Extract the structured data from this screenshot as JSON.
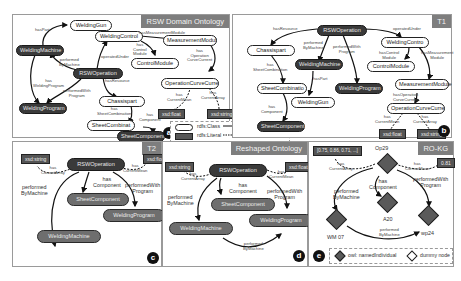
{
  "panels": {
    "a": {
      "title": "RSW Domain Ontology",
      "badge": "a",
      "nodes": {
        "welding_gun": "WeldingGun",
        "welding_machine": "WeldingMachine",
        "welding_control": "WeldingControl",
        "measurement_module": "MeasurementModul",
        "control_module": "ControlModule",
        "rsw_operation": "RSWOperation",
        "welding_program": "WeldingProgram",
        "operation_curve": "OperationCurveCurre",
        "chassis_part": "Chassispart",
        "sheet_combination": "SheetCombinat",
        "sheet_component": "SheetComponent",
        "lit_float": "xsd:float",
        "lit_string": "xsd:string"
      },
      "edges": {
        "has_part": "hasPart",
        "performed_by_machine": "performed\nByMachine",
        "has_welding_program": "has\nWeldingProgram",
        "performed_with_program": "performedWith\nProgram",
        "operated_under": "operatedUnder",
        "has_measurement_module": "hasMeasurementModule",
        "has_control_module": "has\nControl\nModule",
        "has_operation_curve": "has\nOperation\nCurveCurrent",
        "has_resource": "hasResource",
        "has_sheet_combination": "has\nSheetCombination",
        "has_component": "has\nComponent",
        "has_current_mean": "has\nCurrentMean",
        "has_current_array": "has\nCurrentArray"
      },
      "legend": {
        "class_label": "rdfs:Class",
        "literal_label": "rdfs:Literal",
        "object_property": "owl:ObjectProperty",
        "datatype_property": "owl:DatatypeProperty"
      }
    },
    "b": {
      "title": "T1",
      "badge": "b",
      "nodes": {
        "rsw_operation": "RSWOperation",
        "chassis_part": "Chassispart",
        "welding_machine": "WeldingMachine",
        "welding_control": "WeldingContro",
        "control_module": "ControlModule",
        "sheet_combination": "SheetCombinatio",
        "welding_program": "WeldingProgram",
        "measurement_module": "MeasurementModule",
        "welding_gun": "WeldingGun",
        "operation_curve": "OperationCurveCurre",
        "sheet_component": "SheetComponent",
        "lit_float": "xsd:float",
        "lit_string": "xsd:string"
      },
      "edges": {
        "has_resource": "hasResource",
        "performed_by_machine": "performed\nByMachine",
        "performed_with_program": "performedWith\nProgram",
        "operated_under": "operatedUnder",
        "has_sheet_combination": "has\nSheetCombination",
        "has_control_module": "hasControl\nModule",
        "has_measurement_module": "hasMeasurement\nModule",
        "has_part": "hasPart",
        "has_component": "has\nComponent",
        "has_operation_curve": "hasOperation\nCurveCurrent",
        "has_current_mean": "has\nCurrentMean",
        "has_current_array": "has\nCurrentArray"
      }
    },
    "c": {
      "title": "T2",
      "badge": "c",
      "nodes": {
        "lit_string": "xsd:string",
        "rsw_operation": "RSWOperation",
        "lit_float": "xsd:float",
        "sheet_component": "SheetComponent",
        "welding_program": "WeldingProgram",
        "welding_machine": "WeldingMachine"
      },
      "edges": {
        "has_current_array": "has\nCurrentArray",
        "has_current_mean": "has\nCurrentMean",
        "has_component": "has\nComponent",
        "performed_by_machine": "performed\nByMachine",
        "performed_with_program": "performedWith\nProgram"
      }
    },
    "d": {
      "title": "Reshaped Ontology",
      "badge": "d",
      "nodes": {
        "lit_string": "xsd:string",
        "rsw_operation": "RSWOperation",
        "lit_float": "xsd:float",
        "sheet_component": "SheetComponent",
        "welding_machine": "WeldingMachine",
        "welding_program": "WeldingProgram"
      },
      "edges": {
        "has_current_array": "has\nCurrentArray",
        "has_current_mean": "has\nCurrentMean",
        "has_component": "has\nComponent",
        "performed_by_machine": "performed\nByMachine",
        "performed_with_program": "performedWith\nProgram",
        "performed_by_machine_2": "performed\nByMachine"
      }
    },
    "e": {
      "title": "RO-KG",
      "badge": "e",
      "nodes": {
        "array_literal": "[0.75, 0.86, 0.71, ...]",
        "op29": "Op29",
        "float_literal": "0.81",
        "a20": "A20",
        "wm07": "WM 07",
        "wp24": "wp24"
      },
      "edges": {
        "has_current_array": "has\nCurrentArray",
        "has_current_mean": "has\nCurrentMean",
        "has_component": "has\nComponent",
        "performed_by_machine": "performed\nByMachine",
        "performed_with_program": "performedWith\nProgram",
        "performed_by_machine_2": "performed\nByMachine"
      },
      "legend": {
        "named_individual": "owl: namedIndividual",
        "dummy_node": "dummy node"
      }
    }
  },
  "colors": {
    "title_bar": "#7e7e7e",
    "dark_node": "#3a3a3a",
    "mid_node": "#6e6e6e",
    "literal": "#555555",
    "border": "#9a9a9a"
  }
}
